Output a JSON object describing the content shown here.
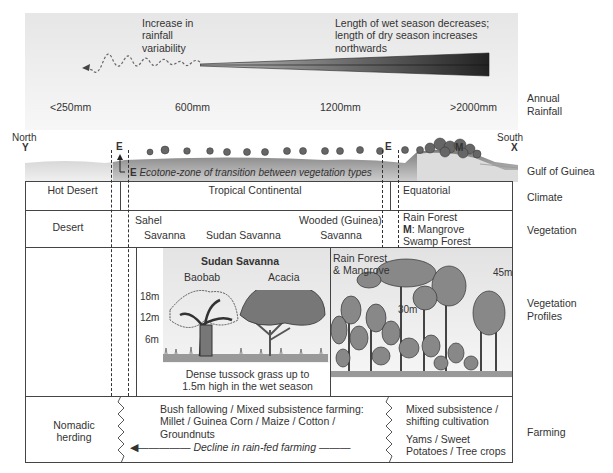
{
  "rainfall": {
    "variability_label": "Increase in\nrainfall\nvariability",
    "wet_season_label": "Length of wet season decreases;\nlength of dry season increases\nnorthwards",
    "values": [
      "<250mm",
      "600mm",
      "1200mm",
      ">2000mm"
    ],
    "row_label": "Annual\nRainfall"
  },
  "profile": {
    "north_label": "North",
    "north_marker": "Y",
    "south_label": "South",
    "south_marker": "X",
    "ecotone_marker_left": "E",
    "ecotone_marker_right": "E",
    "mangrove_marker": "M",
    "ecotone_note_letter": "E",
    "ecotone_note": "Ecotone-zone of transition between vegetation types",
    "gulf_label": "Gulf of Guinea"
  },
  "climate": {
    "row_label": "Climate",
    "zones": [
      "Hot Desert",
      "Tropical Continental",
      "Equatorial"
    ]
  },
  "vegetation": {
    "row_label": "Vegetation",
    "desert": "Desert",
    "sahel_line1": "Sahel",
    "sahel_line2": "Savanna",
    "sudan": "Sudan Savanna",
    "wooded_line1": "Wooded (Guinea)",
    "wooded_line2": "Savanna",
    "rainforest_line1": "Rain Forest",
    "rainforest_m": "M",
    "rainforest_line2": ": Mangrove",
    "rainforest_line3": "Swamp Forest"
  },
  "vegetation_profiles": {
    "row_label": "Vegetation\nProfiles",
    "savanna": {
      "title": "Sudan Savanna",
      "tree1": "Baobab",
      "tree2": "Acacia",
      "heights": [
        "18m",
        "12m",
        "6m"
      ],
      "caption": "Dense tussock grass up to\n1.5m high in the wet season"
    },
    "forest": {
      "title": "Rain Forest\n& Mangrove",
      "heights": [
        "45m",
        "30m"
      ]
    }
  },
  "farming": {
    "row_label": "Farming",
    "nomadic": "Nomadic\nherding",
    "bush": "Bush fallowing / Mixed subsistence farming:\nMillet / Guinea Corn / Maize / Cotton /\nGroundnuts",
    "decline": "Decline in rain-fed farming",
    "mixed": "Mixed subsistence /\nshifting cultivation",
    "crops": "Yams / Sweet\nPotatoes / Tree crops"
  }
}
